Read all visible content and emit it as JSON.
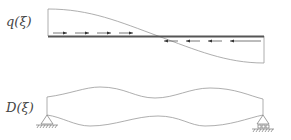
{
  "labels": {
    "load_function": "q(ξ)",
    "stiffness_function": "D(ξ)"
  },
  "diagram": {
    "type": "beam with distributed axial load and varying depth profile",
    "top_panel": {
      "description": "Distributed load q(ξ) along beam, decreasing curve crossing zero at mid-span",
      "arrows_left_half": {
        "count": 4,
        "direction": "right"
      },
      "arrows_right_half": {
        "count": 4,
        "direction": "left"
      }
    },
    "bottom_panel": {
      "description": "Wavy beam profile D(ξ) with pinned support at left and roller support at right",
      "supports": [
        {
          "position": "left",
          "type": "pin"
        },
        {
          "position": "right",
          "type": "roller"
        }
      ]
    },
    "colors": {
      "line": "#888888",
      "beam": "#555555",
      "text": "#444444"
    }
  }
}
